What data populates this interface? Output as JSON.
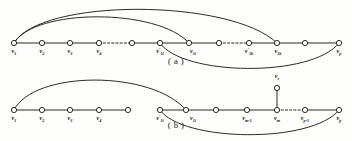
{
  "figure": {
    "width": 352,
    "height": 141,
    "background_color": "#fdfdfc",
    "ink_color": "#17120f",
    "vertex_fill": "#ffffff"
  },
  "panels": [
    {
      "id": "panel-a",
      "caption": "( a )",
      "caption_x": 176,
      "caption_y": 64,
      "baseline_y": 43,
      "vertices": [
        {
          "name": "v1",
          "x": 14,
          "y": 43,
          "label": "v",
          "sub": "1",
          "prime": false,
          "label_x": 14,
          "label_y": 53
        },
        {
          "name": "v2",
          "x": 42,
          "y": 43,
          "label": "v",
          "sub": "2",
          "prime": false,
          "label_x": 42,
          "label_y": 53
        },
        {
          "name": "v3",
          "x": 70,
          "y": 43,
          "label": "v",
          "sub": "3",
          "prime": false,
          "label_x": 70,
          "label_y": 53
        },
        {
          "name": "v4",
          "x": 99,
          "y": 43,
          "label": "v",
          "sub": "4",
          "prime": false,
          "label_x": 99,
          "label_y": 53
        },
        {
          "name": "vmid-a",
          "x": 132,
          "y": 43,
          "label": "",
          "sub": "",
          "prime": false,
          "label_x": 132,
          "label_y": 53
        },
        {
          "name": "v1i-prime",
          "x": 160,
          "y": 43,
          "label": "v",
          "sub": "1i",
          "prime": true,
          "label_x": 160,
          "label_y": 53
        },
        {
          "name": "v1i",
          "x": 189,
          "y": 43,
          "label": "v",
          "sub": "1i",
          "prime": false,
          "label_x": 193,
          "label_y": 53
        },
        {
          "name": "vgap-a",
          "x": 219,
          "y": 43,
          "label": "",
          "sub": "",
          "prime": false,
          "label_x": 219,
          "label_y": 53
        },
        {
          "name": "v1k-prime",
          "x": 249,
          "y": 43,
          "label": "v",
          "sub": "1k",
          "prime": true,
          "label_x": 249,
          "label_y": 53
        },
        {
          "name": "v1k",
          "x": 277,
          "y": 43,
          "label": "v",
          "sub": "1k",
          "prime": false,
          "label_x": 278,
          "label_y": 53
        },
        {
          "name": "vnear-p-a",
          "x": 305,
          "y": 43,
          "label": "",
          "sub": "",
          "prime": false,
          "label_x": 305,
          "label_y": 53
        },
        {
          "name": "vp",
          "x": 339,
          "y": 43,
          "label": "v",
          "sub": "p",
          "prime": false,
          "label_x": 339,
          "label_y": 53
        }
      ],
      "solid_edges": [
        [
          14,
          42
        ],
        [
          42,
          70
        ],
        [
          70,
          99
        ],
        [
          132,
          160
        ],
        [
          160,
          189
        ],
        [
          189,
          219
        ],
        [
          249,
          277
        ],
        [
          277,
          305
        ],
        [
          305,
          339
        ]
      ],
      "dashed_edges": [
        [
          99,
          132
        ],
        [
          219,
          249
        ]
      ],
      "arcs": [
        {
          "name": "arc-v1-to-v1k",
          "from_x": 14,
          "from_y": 43,
          "to_x": 277,
          "to_y": 43,
          "apex_y": 7,
          "direction": "up"
        },
        {
          "name": "arc-v1-to-v1i",
          "from_x": 14,
          "from_y": 43,
          "to_x": 189,
          "to_y": 43,
          "apex_y": 16,
          "direction": "up"
        },
        {
          "name": "arc-v1iprime-to-vp",
          "from_x": 160,
          "from_y": 43,
          "to_x": 339,
          "to_y": 43,
          "apex_y": 67,
          "direction": "down"
        }
      ]
    },
    {
      "id": "panel-b",
      "caption": "( b )",
      "caption_x": 176,
      "caption_y": 128,
      "baseline_y": 110,
      "vertices": [
        {
          "name": "v1-b",
          "x": 14,
          "y": 110,
          "label": "v",
          "sub": "1",
          "prime": false,
          "label_x": 14,
          "label_y": 120
        },
        {
          "name": "v2-b",
          "x": 42,
          "y": 110,
          "label": "v",
          "sub": "2",
          "prime": false,
          "label_x": 42,
          "label_y": 120
        },
        {
          "name": "v3-b",
          "x": 70,
          "y": 110,
          "label": "v",
          "sub": "3",
          "prime": false,
          "label_x": 70,
          "label_y": 120
        },
        {
          "name": "v4-b",
          "x": 99,
          "y": 110,
          "label": "v",
          "sub": "4",
          "prime": false,
          "label_x": 99,
          "label_y": 120
        },
        {
          "name": "vmid-b",
          "x": 128,
          "y": 110,
          "label": "",
          "sub": "",
          "prime": false,
          "label_x": 128,
          "label_y": 120
        },
        {
          "name": "v1i-prime-b",
          "x": 160,
          "y": 110,
          "label": "v",
          "sub": "1i",
          "prime": true,
          "label_x": 160,
          "label_y": 120
        },
        {
          "name": "v1i-b",
          "x": 186,
          "y": 110,
          "label": "v",
          "sub": "1i",
          "prime": false,
          "label_x": 193,
          "label_y": 120
        },
        {
          "name": "vplain-b",
          "x": 216,
          "y": 110,
          "label": "",
          "sub": "",
          "prime": false,
          "label_x": 216,
          "label_y": 120
        },
        {
          "name": "vm-1",
          "x": 247,
          "y": 110,
          "label": "v",
          "sub": "m-1",
          "prime": false,
          "label_x": 247,
          "label_y": 120
        },
        {
          "name": "vm",
          "x": 277,
          "y": 110,
          "label": "v",
          "sub": "m",
          "prime": false,
          "label_x": 277,
          "label_y": 120
        },
        {
          "name": "vp-1",
          "x": 305,
          "y": 110,
          "label": "v",
          "sub": "p-1",
          "prime": false,
          "label_x": 305,
          "label_y": 120
        },
        {
          "name": "vp-b",
          "x": 339,
          "y": 110,
          "label": "v",
          "sub": "p",
          "prime": false,
          "label_x": 339,
          "label_y": 120
        }
      ],
      "pendant_vertex": {
        "name": "vz",
        "x": 277,
        "y": 88,
        "label": "v",
        "sub": "z",
        "prime": false,
        "label_x": 277,
        "label_y": 78,
        "attached_to": "vm"
      },
      "solid_edges": [
        [
          14,
          42
        ],
        [
          42,
          70
        ],
        [
          70,
          99
        ],
        [
          99,
          128
        ],
        [
          160,
          186
        ],
        [
          186,
          216
        ],
        [
          216,
          247
        ],
        [
          247,
          277
        ],
        [
          305,
          339
        ]
      ],
      "dashed_edges": [
        [
          277,
          305
        ]
      ],
      "arcs": [
        {
          "name": "arc-v1-to-v1i-b",
          "from_x": 14,
          "from_y": 110,
          "to_x": 186,
          "to_y": 110,
          "apex_y": 76,
          "direction": "up"
        },
        {
          "name": "arc-v1iprime-to-vp-b",
          "from_x": 160,
          "from_y": 110,
          "to_x": 339,
          "to_y": 110,
          "apex_y": 134,
          "direction": "down"
        }
      ]
    }
  ],
  "geometry": {
    "vertex_radius": 2.6,
    "stroke_width": 0.9,
    "dash_pattern": "2.2 2.0"
  }
}
